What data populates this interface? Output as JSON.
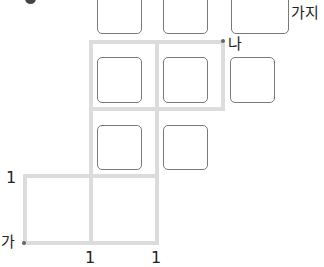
{
  "problem": {
    "badge": "",
    "unit_label": "가지",
    "start_label": "가",
    "end_label": "나",
    "edge_labels": {
      "left": "1",
      "bottom_1": "1",
      "bottom_2": "1"
    }
  },
  "grid": {
    "line_color": "#dcdcdc",
    "segments": [
      {
        "orientation": "h",
        "y": 42,
        "x1": 91,
        "x2": 223
      },
      {
        "orientation": "h",
        "y": 109,
        "x1": 91,
        "x2": 223
      },
      {
        "orientation": "h",
        "y": 176,
        "x1": 25,
        "x2": 157
      },
      {
        "orientation": "h",
        "y": 243,
        "x1": 25,
        "x2": 157
      },
      {
        "orientation": "v",
        "x": 25,
        "y1": 176,
        "y2": 243
      },
      {
        "orientation": "v",
        "x": 91,
        "y1": 42,
        "y2": 243
      },
      {
        "orientation": "v",
        "x": 157,
        "y1": 42,
        "y2": 243
      },
      {
        "orientation": "v",
        "x": 223,
        "y1": 42,
        "y2": 109
      }
    ]
  },
  "answer_boxes": [
    {
      "id": "r1c1",
      "value": ""
    },
    {
      "id": "r1c2",
      "value": ""
    },
    {
      "id": "answer",
      "value": ""
    },
    {
      "id": "r2c1",
      "value": ""
    },
    {
      "id": "r2c2",
      "value": ""
    },
    {
      "id": "r2c3",
      "value": ""
    },
    {
      "id": "r3c1",
      "value": ""
    },
    {
      "id": "r3c2",
      "value": ""
    }
  ]
}
